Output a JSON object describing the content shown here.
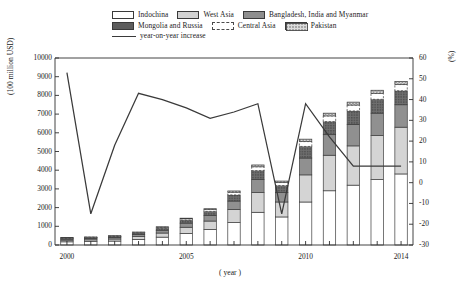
{
  "legend": {
    "rows": [
      [
        {
          "key": "indochina",
          "label": "Indochina",
          "swatch": "indochina"
        },
        {
          "key": "west_asia",
          "label": "West Asia",
          "swatch": "westasia"
        },
        {
          "key": "bim",
          "label": "Bangladesh, India and Myanmar",
          "swatch": "bim"
        }
      ],
      [
        {
          "key": "mongolia_russia",
          "label": "Mongolia and Russia",
          "swatch": "mongolia"
        },
        {
          "key": "central_asia",
          "label": "Central Asia",
          "swatch": "central"
        },
        {
          "key": "pakistan",
          "label": "Pakistan",
          "swatch": "pakistan"
        }
      ],
      [
        {
          "key": "yoy",
          "label": "year-on-year increase",
          "swatch": "line"
        }
      ]
    ]
  },
  "chart_data": {
    "type": "bar",
    "title": "",
    "subtitle": "",
    "xlabel": "( year )",
    "ylabel": "(100 million USD)",
    "y2label": "(%)",
    "grid": false,
    "legend_position": "top",
    "categories": [
      2000,
      2001,
      2002,
      2003,
      2004,
      2005,
      2006,
      2007,
      2008,
      2009,
      2010,
      2011,
      2012,
      2013,
      2014
    ],
    "xtick_labels": [
      "2000",
      "2005",
      "2010",
      "2014"
    ],
    "xtick_values": [
      2000,
      2005,
      2010,
      2014
    ],
    "ylim": [
      0,
      10000
    ],
    "ytick_labels": [
      "0",
      "1000",
      "2000",
      "3000",
      "4000",
      "5000",
      "6000",
      "7000",
      "8000",
      "9000",
      "10000"
    ],
    "ytick_values": [
      0,
      1000,
      2000,
      3000,
      4000,
      5000,
      6000,
      7000,
      8000,
      9000,
      10000
    ],
    "y2lim": [
      -30,
      60
    ],
    "y2tick_labels": [
      "-30",
      "-20",
      "-10",
      "0",
      "10",
      "20",
      "30",
      "40",
      "50",
      "60"
    ],
    "y2tick_values": [
      -30,
      -20,
      -10,
      0,
      10,
      20,
      30,
      40,
      50,
      60
    ],
    "stack_order": [
      "indochina",
      "west_asia",
      "bim",
      "mongolia_russia",
      "central_asia",
      "pakistan"
    ],
    "series": [
      {
        "name": "Indochina",
        "key": "indochina",
        "color": "#ffffff",
        "values": [
          170,
          180,
          210,
          300,
          420,
          620,
          830,
          1200,
          1750,
          1500,
          2300,
          2900,
          3200,
          3500,
          3800
        ]
      },
      {
        "name": "West Asia",
        "key": "west_asia",
        "color": "#d2d2d2",
        "values": [
          90,
          95,
          110,
          150,
          220,
          330,
          450,
          700,
          1050,
          800,
          1450,
          1900,
          2100,
          2350,
          2500
        ]
      },
      {
        "name": "Bangladesh, India and Myanmar",
        "key": "bim",
        "color": "#8e8e8e",
        "values": [
          60,
          65,
          80,
          110,
          150,
          220,
          300,
          450,
          700,
          500,
          900,
          1100,
          1150,
          1200,
          1200
        ]
      },
      {
        "name": "Mongolia and Russia",
        "key": "mongolia_russia",
        "color": "#5d5d5d",
        "values": [
          50,
          55,
          60,
          80,
          110,
          160,
          220,
          330,
          480,
          380,
          620,
          700,
          720,
          740,
          750
        ]
      },
      {
        "name": "Central Asia",
        "key": "central_asia",
        "color": "#ffffff",
        "values": [
          20,
          22,
          25,
          35,
          50,
          70,
          95,
          140,
          200,
          160,
          260,
          300,
          310,
          320,
          330
        ]
      },
      {
        "name": "Pakistan",
        "key": "pakistan",
        "color": "#cfcfcf",
        "values": [
          10,
          12,
          14,
          18,
          25,
          35,
          45,
          70,
          100,
          80,
          130,
          150,
          160,
          165,
          170
        ]
      }
    ],
    "totals": [
      400,
      429,
      499,
      693,
      975,
      1435,
      1940,
      2890,
      4280,
      3420,
      5660,
      7050,
      7640,
      8275,
      8750
    ],
    "line_series": {
      "name": "year-on-year increase",
      "color": "#3a3a3a",
      "axis": "right",
      "values": [
        53,
        -15,
        18,
        43,
        40,
        36,
        31,
        34,
        38,
        -15,
        38,
        22,
        8,
        8,
        8
      ]
    }
  }
}
